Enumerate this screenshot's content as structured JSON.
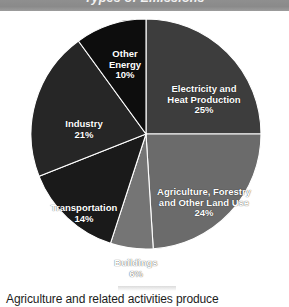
{
  "header": {
    "title": "Types of Emissions",
    "background_color": "#8f8f8f",
    "text_color": "#f2f2f2"
  },
  "caption": {
    "text": "Agriculture and related activities produce"
  },
  "chart_data": {
    "type": "pie",
    "title": "Types of Emissions",
    "xlabel": "",
    "ylabel": "",
    "legend_position": "none",
    "grid": false,
    "units": "percent",
    "total": 100,
    "start_angle_deg": 0,
    "direction": "clockwise",
    "categories": [
      "Electricity and Heat Production",
      "Agriculture, Forestry and Other Land Use",
      "Buildings",
      "Transportation",
      "Industry",
      "Other Energy"
    ],
    "values": [
      25,
      24,
      6,
      14,
      21,
      10
    ],
    "colors": [
      "#3d3d3d",
      "#6b6b6b",
      "#757575",
      "#1a1a1a",
      "#262626",
      "#0d0d0d"
    ],
    "slices": [
      {
        "label": "Electricity and Heat Production",
        "label_line_1": "Electricity and",
        "label_line_2": "Heat Production",
        "value": 25,
        "value_label": "25%",
        "color": "#3d3d3d"
      },
      {
        "label": "Agriculture, Forestry and Other Land Use",
        "label_line_1": "Agriculture, Forestry",
        "label_line_2": "and Other Land Use",
        "value": 24,
        "value_label": "24%",
        "color": "#6b6b6b"
      },
      {
        "label": "Buildings",
        "label_line_1": "Buildings",
        "label_line_2": "",
        "value": 6,
        "value_label": "6%",
        "color": "#757575"
      },
      {
        "label": "Transportation",
        "label_line_1": "Transportation",
        "label_line_2": "",
        "value": 14,
        "value_label": "14%",
        "color": "#1a1a1a"
      },
      {
        "label": "Industry",
        "label_line_1": "Industry",
        "label_line_2": "",
        "value": 21,
        "value_label": "21%",
        "color": "#262626"
      },
      {
        "label": "Other Energy",
        "label_line_1": "Other",
        "label_line_2": "Energy",
        "value": 10,
        "value_label": "10%",
        "color": "#0d0d0d"
      }
    ]
  }
}
